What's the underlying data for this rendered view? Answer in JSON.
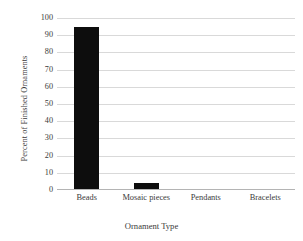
{
  "chart_data": {
    "type": "bar",
    "title": "",
    "xlabel": "Ornament Type",
    "ylabel": "Percent of Finished Ornaments",
    "categories": [
      "Beads",
      "Mosaic pieces",
      "Pendants",
      "Bracelets"
    ],
    "values": [
      94.5,
      4.3,
      0.8,
      0.6
    ],
    "ylim": [
      0,
      100
    ],
    "yticks": [
      0,
      10,
      20,
      30,
      40,
      50,
      60,
      70,
      80,
      90,
      100
    ],
    "ytick_labels": [
      "0",
      "10",
      "20",
      "30",
      "40",
      "50",
      "60",
      "70",
      "80",
      "90",
      "100"
    ],
    "grid": true,
    "legend": false,
    "bar_color": "#0d0d0d",
    "grid_color": "#d9d9d9",
    "axis_color": "#b4b4b4",
    "text_color": "#3a3a3a",
    "background": "#ffffff"
  }
}
